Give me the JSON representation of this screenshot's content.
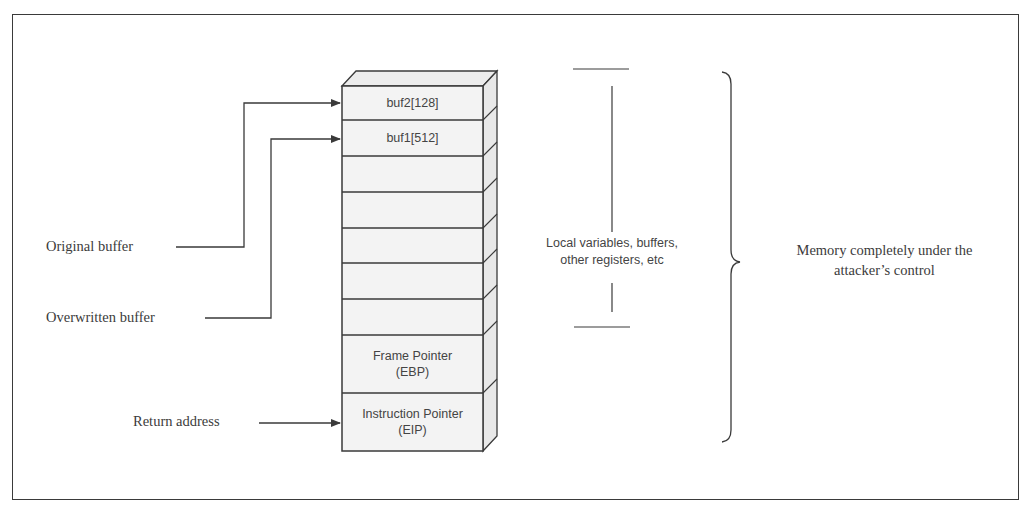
{
  "diagram": {
    "type": "stack-memory-layout",
    "stack_cells": [
      {
        "label": "buf2[128]"
      },
      {
        "label": "buf1[512]"
      },
      {
        "label": ""
      },
      {
        "label": ""
      },
      {
        "label": ""
      },
      {
        "label": ""
      },
      {
        "label": ""
      },
      {
        "label_line1": "Frame Pointer",
        "label_line2": "(EBP)"
      },
      {
        "label_line1": "Instruction Pointer",
        "label_line2": "(EIP)"
      }
    ],
    "left_labels": {
      "original_buffer": "Original buffer",
      "overwritten_buffer": "Overwritten buffer",
      "return_address": "Return address"
    },
    "span_label": {
      "line1": "Local variables, buffers,",
      "line2": "other registers, etc"
    },
    "brace_label": {
      "line1": "Memory completely under the",
      "line2": "attacker’s control"
    },
    "colors": {
      "line": "#3a3a3a",
      "cell_fill": "#f3f3f3",
      "text": "#444444"
    }
  }
}
